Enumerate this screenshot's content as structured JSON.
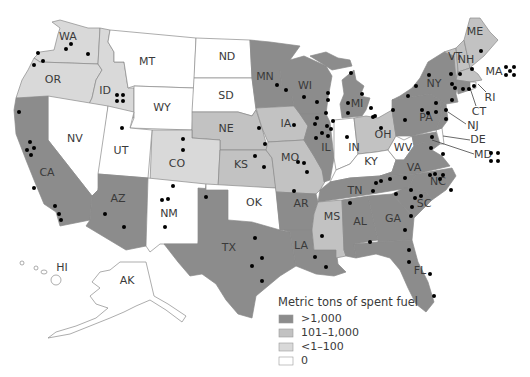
{
  "title": "Metric tons of spent fuel",
  "legend": {
    "title": "Metric tons of spent fuel",
    "items": [
      {
        "label": ">1,000",
        "color": "#8c8c8c"
      },
      {
        "label": "101–1,000",
        "color": "#c2c2c2"
      },
      {
        "label": "<1–100",
        "color": "#d9d9d9"
      },
      {
        "label": "0",
        "color": "#ffffff"
      }
    ]
  },
  "colors": {
    "high": "#8c8c8c",
    "mid": "#c2c2c2",
    "low": "#d9d9d9",
    "zero": "#ffffff",
    "border": "#8a8a8a",
    "dot": "#000000"
  },
  "states": {
    "WA": {
      "label": "WA",
      "category": "<1-100"
    },
    "OR": {
      "label": "OR",
      "category": "<1-100"
    },
    "ID": {
      "label": "ID",
      "category": "<1-100"
    },
    "MT": {
      "label": "MT",
      "category": "0"
    },
    "WY": {
      "label": "WY",
      "category": "0"
    },
    "ND": {
      "label": "ND",
      "category": "0"
    },
    "SD": {
      "label": "SD",
      "category": "0"
    },
    "NE": {
      "label": "NE",
      "category": "101-1,000"
    },
    "KS": {
      "label": "KS",
      "category": "101-1,000"
    },
    "CO": {
      "label": "CO",
      "category": "<1-100"
    },
    "NV": {
      "label": "NV",
      "category": "0"
    },
    "UT": {
      "label": "UT",
      "category": "0"
    },
    "CA": {
      "label": "CA",
      "category": ">1,000"
    },
    "AZ": {
      "label": "AZ",
      "category": ">1,000"
    },
    "NM": {
      "label": "NM",
      "category": "0"
    },
    "TX": {
      "label": "TX",
      "category": ">1,000"
    },
    "OK": {
      "label": "OK",
      "category": "0"
    },
    "MN": {
      "label": "MN",
      "category": ">1,000"
    },
    "IA": {
      "label": "IA",
      "category": "101-1,000"
    },
    "MO": {
      "label": "MO",
      "category": "101-1,000"
    },
    "AR": {
      "label": "AR",
      "category": ">1,000"
    },
    "LA": {
      "label": "LA",
      "category": ">1,000"
    },
    "WI": {
      "label": "WI",
      "category": ">1,000"
    },
    "IL": {
      "label": "IL",
      "category": ">1,000"
    },
    "MI": {
      "label": "MI",
      "category": ">1,000"
    },
    "IN": {
      "label": "IN",
      "category": "0"
    },
    "OH": {
      "label": "OH",
      "category": "101-1,000"
    },
    "KY": {
      "label": "KY",
      "category": "0"
    },
    "WV": {
      "label": "WV",
      "category": "0"
    },
    "TN": {
      "label": "TN",
      "category": ">1,000"
    },
    "MS": {
      "label": "MS",
      "category": "101-1,000"
    },
    "AL": {
      "label": "AL",
      "category": ">1,000"
    },
    "GA": {
      "label": "GA",
      "category": ">1,000"
    },
    "FL": {
      "label": "FL",
      "category": ">1,000"
    },
    "SC": {
      "label": "SC",
      "category": ">1,000"
    },
    "NC": {
      "label": "NC",
      "category": ">1,000"
    },
    "VA": {
      "label": "VA",
      "category": ">1,000"
    },
    "PA": {
      "label": "PA",
      "category": ">1,000"
    },
    "NY": {
      "label": "NY",
      "category": ">1,000"
    },
    "VT": {
      "label": "VT",
      "category": "101-1,000"
    },
    "NH": {
      "label": "NH",
      "category": "101-1,000"
    },
    "ME": {
      "label": "ME",
      "category": "101-1,000"
    },
    "MA": {
      "label": "MA",
      "category": "101-1,000"
    },
    "RI": {
      "label": "RI",
      "category": "0"
    },
    "CT": {
      "label": "CT",
      "category": ">1,000"
    },
    "NJ": {
      "label": "NJ",
      "category": ">1,000"
    },
    "DE": {
      "label": "DE",
      "category": "0"
    },
    "MD": {
      "label": "MD",
      "category": ">1,000"
    },
    "HI": {
      "label": "HI",
      "category": "0"
    },
    "AK": {
      "label": "AK",
      "category": "0"
    }
  }
}
